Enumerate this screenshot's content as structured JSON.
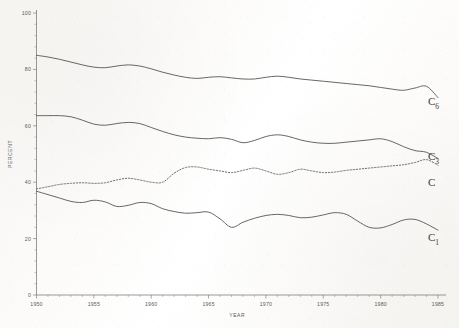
{
  "figure": {
    "background_color": "#fbfaf8",
    "ink_color": "#4b4b49"
  },
  "axes": {
    "y_title": "PERCENT",
    "x_title": "YEAR",
    "y_ticks": [
      "100",
      "80",
      "60",
      "40",
      "20",
      "0"
    ],
    "x_ticks": [
      "1950",
      "1955",
      "1960",
      "1965",
      "1970",
      "1975",
      "1980",
      "1985"
    ]
  },
  "series_labels": {
    "c6": {
      "base": "C",
      "sub": "6"
    },
    "c3": {
      "base": "C",
      "sub": "3"
    },
    "c": {
      "base": "C",
      "sub": ""
    },
    "c1": {
      "base": "C",
      "sub": "1"
    }
  },
  "chart_data": {
    "type": "line",
    "title": "",
    "xlabel": "YEAR",
    "ylabel": "PERCENT",
    "xlim": [
      1950,
      1985
    ],
    "ylim": [
      0,
      100
    ],
    "grid": false,
    "legend": "inline-right-end-labels",
    "x": [
      1950,
      1951,
      1952,
      1953,
      1954,
      1955,
      1956,
      1957,
      1958,
      1959,
      1960,
      1961,
      1962,
      1963,
      1964,
      1965,
      1966,
      1967,
      1968,
      1969,
      1970,
      1971,
      1972,
      1973,
      1974,
      1975,
      1976,
      1977,
      1978,
      1979,
      1980,
      1981,
      1982,
      1983,
      1984,
      1985
    ],
    "series": [
      {
        "name": "C6",
        "label": "C6",
        "style": "solid",
        "values": [
          85.0,
          84.4,
          83.6,
          82.6,
          81.6,
          80.8,
          80.6,
          81.2,
          81.6,
          81.2,
          80.2,
          79.0,
          78.0,
          77.2,
          76.8,
          77.2,
          77.4,
          77.0,
          76.6,
          76.6,
          77.2,
          77.6,
          77.2,
          76.6,
          76.2,
          75.8,
          75.4,
          75.0,
          74.6,
          74.2,
          73.6,
          73.0,
          72.6,
          73.4,
          74.0,
          70.0
        ]
      },
      {
        "name": "C3",
        "label": "C3",
        "style": "solid",
        "values": [
          63.6,
          63.6,
          63.6,
          63.2,
          62.0,
          60.6,
          60.2,
          60.8,
          61.2,
          60.8,
          59.4,
          58.0,
          56.8,
          56.0,
          55.6,
          55.4,
          55.8,
          55.2,
          54.0,
          54.8,
          56.2,
          56.8,
          56.2,
          55.0,
          54.2,
          53.8,
          53.8,
          54.2,
          54.6,
          55.0,
          55.4,
          54.4,
          52.6,
          51.2,
          50.6,
          48.4
        ]
      },
      {
        "name": "C",
        "label": "C",
        "style": "dotted",
        "values": [
          37.6,
          38.4,
          39.2,
          39.6,
          39.8,
          39.6,
          39.8,
          40.8,
          41.4,
          40.8,
          40.0,
          40.0,
          43.2,
          45.2,
          45.4,
          44.6,
          44.0,
          43.4,
          44.2,
          45.0,
          44.0,
          42.8,
          43.4,
          44.6,
          44.0,
          43.4,
          43.6,
          44.2,
          44.6,
          45.0,
          45.4,
          45.8,
          46.2,
          47.0,
          48.0,
          46.0
        ]
      },
      {
        "name": "C1",
        "label": "C1",
        "style": "solid",
        "values": [
          36.8,
          35.6,
          34.4,
          33.2,
          32.8,
          33.6,
          33.0,
          31.4,
          31.8,
          32.8,
          32.4,
          30.6,
          29.6,
          29.0,
          29.2,
          29.4,
          27.0,
          24.0,
          25.8,
          27.2,
          28.2,
          28.6,
          28.2,
          27.4,
          27.6,
          28.4,
          29.2,
          28.6,
          26.2,
          24.0,
          23.8,
          25.0,
          26.6,
          26.8,
          25.2,
          23.0
        ]
      }
    ]
  }
}
